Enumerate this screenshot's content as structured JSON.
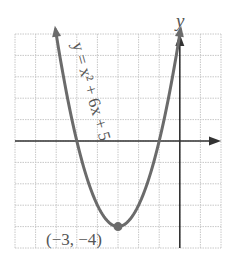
{
  "chart_data": {
    "type": "line",
    "title": "",
    "equation_label": "y = x² + 6x + 5",
    "function": "x^2 + 6x + 5",
    "xlabel": "",
    "ylabel": "y",
    "xlim": [
      -8,
      2
    ],
    "ylim": [
      -5,
      5
    ],
    "grid": true,
    "vertex": {
      "x": -3,
      "y": -4,
      "label": "(−3, −4)"
    },
    "x_intercepts": [
      -5,
      -1
    ],
    "y_intercept": 5,
    "series": [
      {
        "name": "y = x² + 6x + 5",
        "x": [
          -6.3,
          -6,
          -5,
          -4,
          -3,
          -2,
          -1,
          0,
          0.3
        ],
        "y": [
          6.19,
          5,
          0,
          -3,
          -4,
          -3,
          0,
          5,
          6.89
        ]
      }
    ],
    "colors": {
      "curve": "#6b6b6b",
      "axes": "#333333",
      "grid": "#c8c8c8"
    }
  },
  "labels": {
    "y_axis": "y",
    "equation": "y = x² + 6x + 5",
    "vertex": "(−3, −4)"
  }
}
